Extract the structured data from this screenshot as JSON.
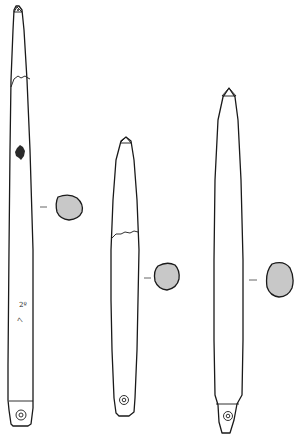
{
  "figure": {
    "section_fill": "#c8c8c8",
    "line_color": "#1a1a1a",
    "objects": [
      {
        "id": "object-1",
        "has_break_line": true,
        "has_damage_patch": true,
        "inscription": "2º 7",
        "section_shape": "round"
      },
      {
        "id": "object-2",
        "has_break_line": true,
        "has_damage_patch": false,
        "inscription": "",
        "section_shape": "round"
      },
      {
        "id": "object-3",
        "has_break_line": false,
        "has_damage_patch": false,
        "inscription": "",
        "section_shape": "oval"
      }
    ]
  }
}
